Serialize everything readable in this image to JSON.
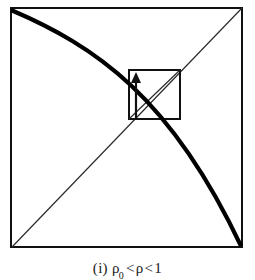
{
  "figure": {
    "caption_index": "(i)",
    "caption_left_symbol": "ρ",
    "caption_left_subscript": "0",
    "caption_relation_1": "<",
    "caption_middle_symbol": "ρ",
    "caption_relation_2": "<",
    "caption_right_value": "1",
    "caption_full": "(i) ρ0 < ρ < 1",
    "colors": {
      "ink": "#111111",
      "thin_line": "#2b2b2b",
      "thick_curve": "#000000",
      "background": "#ffffff",
      "caption_text": "#1a1a1a"
    },
    "outer_square": {
      "name": "unit-square",
      "left": 11,
      "top": 8,
      "right": 242,
      "bottom": 247,
      "stroke_width": 2.0
    },
    "inner_square": {
      "name": "inner-square",
      "left": 129,
      "top": 70,
      "right": 180,
      "bottom": 119,
      "stroke_width": 2.0
    },
    "diagonal_main": {
      "name": "identity-diagonal",
      "x1": 12,
      "y1": 247,
      "x2": 242,
      "y2": 8,
      "stroke_width": 1.2
    },
    "inner_diagonal": {
      "name": "inner-square-diagonal",
      "x1": 129,
      "y1": 119,
      "x2": 180,
      "y2": 70,
      "stroke_width": 1.2
    },
    "curve": {
      "name": "decreasing-map-curve",
      "start_x": 11,
      "start_y": 10,
      "control1_x": 95,
      "control1_y": 46,
      "control2_x": 170,
      "control2_y": 96,
      "end_x": 241,
      "end_y": 246,
      "stroke_width": 4.2
    },
    "arrow": {
      "name": "upward-iteration-arrow",
      "x": 136,
      "y_tail": 119,
      "y_head": 74,
      "shaft_width": 2.2,
      "head_half_width": 5,
      "head_length": 11
    }
  }
}
